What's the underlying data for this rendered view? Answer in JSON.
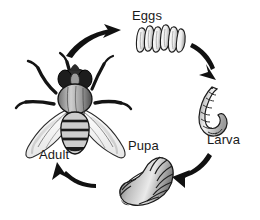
{
  "diagram": {
    "type": "cycle",
    "direction": "clockwise",
    "background_color": "#ffffff",
    "ink_color": "#1a1a1a",
    "stages": [
      {
        "id": "adult",
        "label": "Adult",
        "position": "left",
        "illustration": "adult-fly",
        "description": "Adult housefly seen from above with outstretched legs, two translucent wings and a banded abdomen"
      },
      {
        "id": "eggs",
        "label": "Eggs",
        "position": "top",
        "illustration": "egg-cluster",
        "description": "Cluster of several elongated pale eggs lying side by side",
        "egg_count": 6
      },
      {
        "id": "larva",
        "label": "Larva",
        "position": "right",
        "illustration": "larva-maggot",
        "description": "Curved segmented maggot tapering toward the head",
        "segment_count": 9
      },
      {
        "id": "pupa",
        "label": "Pupa",
        "position": "bottom",
        "illustration": "pupa-puparium",
        "description": "Barrel shaped ridged puparium with dark banding",
        "segment_count": 10
      }
    ],
    "arrows": [
      {
        "id": "adult-to-eggs",
        "from": "Adult",
        "to": "Eggs",
        "direction": "up-right"
      },
      {
        "id": "eggs-to-larva",
        "from": "Eggs",
        "to": "Larva",
        "direction": "down-right"
      },
      {
        "id": "larva-to-pupa",
        "from": "Larva",
        "to": "Pupa",
        "direction": "down-left"
      },
      {
        "id": "pupa-to-adult",
        "from": "Pupa",
        "to": "Adult",
        "direction": "up-left"
      }
    ]
  }
}
